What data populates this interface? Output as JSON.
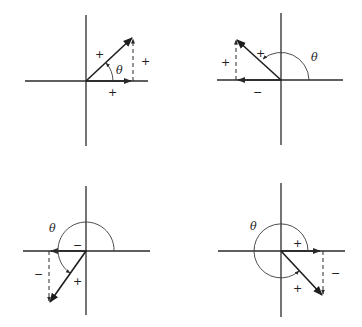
{
  "figure": {
    "theta_symbol": "θ",
    "panels": [
      {
        "id": "quadrant-1",
        "vector_sign": "+",
        "x_component_sign": "+",
        "y_component_sign": "+",
        "theta_label": "θ"
      },
      {
        "id": "quadrant-2",
        "vector_sign": "+",
        "x_component_sign": "−",
        "y_component_sign": "+",
        "theta_label": "θ"
      },
      {
        "id": "quadrant-3",
        "vector_sign": "+",
        "x_component_sign": "−",
        "y_component_sign": "−",
        "theta_label": "θ"
      },
      {
        "id": "quadrant-4",
        "vector_sign": "+",
        "x_component_sign": "+",
        "y_component_sign": "−",
        "theta_label": "θ"
      }
    ]
  }
}
